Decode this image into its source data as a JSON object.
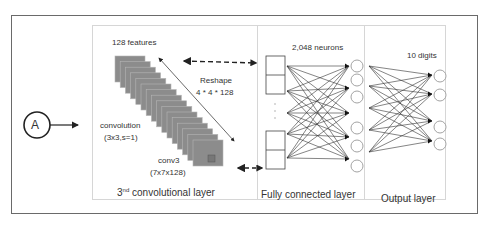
{
  "input_node": {
    "label": "A"
  },
  "conv_layer": {
    "title_main": "3",
    "title_sup": "nd",
    "title_rest": " convolutional layer",
    "features_label": "128 features",
    "reshape_label": "Reshape",
    "reshape_dims": "4 * 4 * 128",
    "convolution_label": "convolution",
    "convolution_params": "(3x3,s=1)",
    "conv_name": "conv3",
    "conv_shape": "(7x7x128)"
  },
  "fc_layer": {
    "title": "Fully connected layer",
    "neurons_label": "2,048 neurons"
  },
  "output_layer": {
    "title": "Output layer",
    "digits_label": "10 digits"
  },
  "colors": {
    "feature_map": "#8c8c8c",
    "border": "#6a6a6a",
    "panel_border": "#d6d6d6",
    "line": "#222222"
  }
}
